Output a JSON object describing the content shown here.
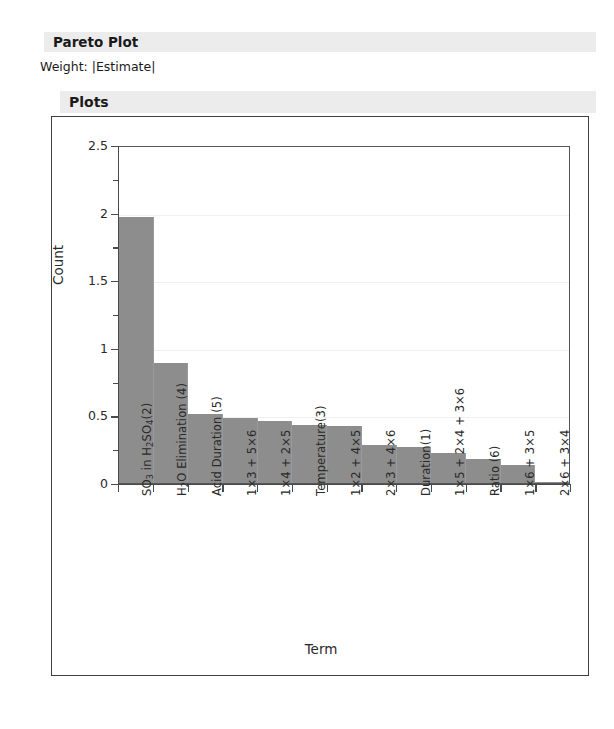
{
  "report": {
    "pareto_title": "Pareto Plot",
    "weight_line": "Weight: |Estimate|",
    "plots_title": "Plots"
  },
  "colors": {
    "bar_fill": "#8d8d8d",
    "header_bar": "#ececec",
    "frame": "#404040",
    "gridline": "#f0eeee",
    "axis": "#4a4a4a"
  },
  "chart_data": {
    "type": "bar",
    "title": "",
    "xlabel": "Term",
    "ylabel": "Count",
    "ylim": [
      0,
      2.5
    ],
    "ytick_labels": [
      "0",
      "0.5",
      "1",
      "1.5",
      "2",
      "2.5"
    ],
    "ytick_values": [
      0,
      0.5,
      1,
      1.5,
      2,
      2.5
    ],
    "yminor_values": [
      0.25,
      0.75,
      1.25,
      1.75,
      2.25
    ],
    "grid": true,
    "grid_axis": "y",
    "legend": "none",
    "bar_gap": 0,
    "categories": [
      "SO₃ in H₂SO₄(2)",
      "H₂O Elimination (4)",
      "Acid Duration (5)",
      "1×3 + 5×6",
      "1×4 + 2×5",
      "Temperature(3)",
      "1×2 + 4×5",
      "2×3 + 4×6",
      "Duration(1)",
      "1×5 + 2×4 + 3×6",
      "Ratio (6)",
      "1×6 + 3×5",
      "2×6 + 3×4"
    ],
    "categories_html": [
      "SO<sub>3</sub> in H<sub>2</sub>SO<sub>4</sub>(2)",
      "H<sub>2</sub>O Elimination (4)",
      "Acid Duration (5)",
      "1×3 + 5×6",
      "1×4 + 2×5",
      "Temperature(3)",
      "1×2 + 4×5",
      "2×3 + 4×6",
      "Duration(1)",
      "1×5 + 2×4 + 3×6",
      "Ratio (6)",
      "1×6 + 3×5",
      "2×6 + 3×4"
    ],
    "values": [
      1.97,
      0.89,
      0.51,
      0.48,
      0.46,
      0.43,
      0.42,
      0.28,
      0.27,
      0.22,
      0.18,
      0.13,
      0.01
    ]
  }
}
